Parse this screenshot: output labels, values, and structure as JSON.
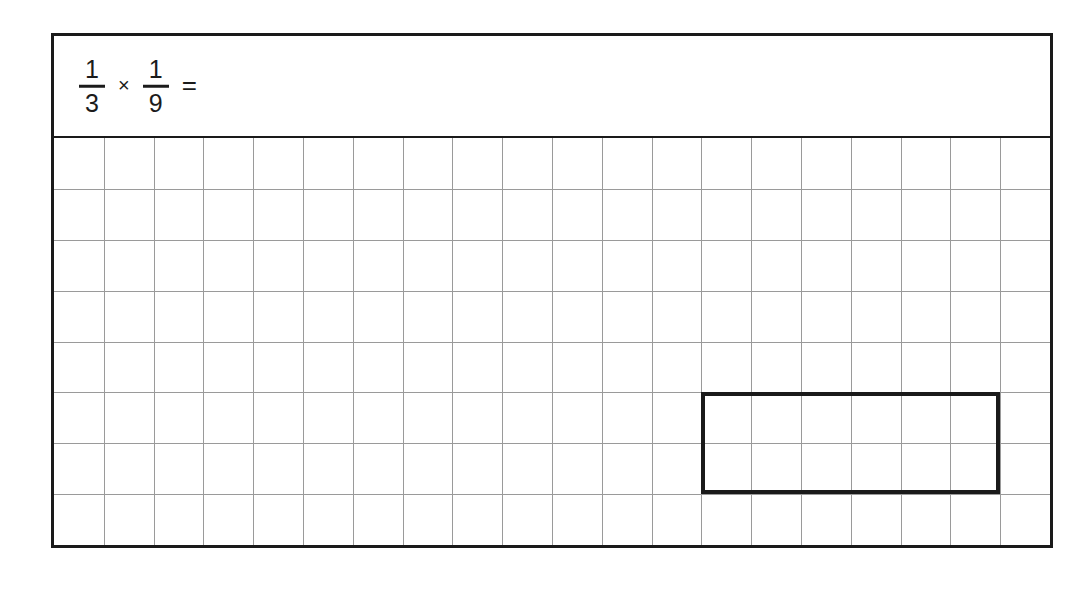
{
  "page": {
    "background_color": "#ffffff",
    "width": 1090,
    "height": 591
  },
  "worksheet": {
    "border_color": "#1a1a1a",
    "background_color": "#ffffff"
  },
  "problem": {
    "first_fraction": {
      "numerator": "1",
      "denominator": "3"
    },
    "operator": "×",
    "second_fraction": {
      "numerator": "1",
      "denominator": "9"
    },
    "equals": "=",
    "answer": ""
  },
  "grid": {
    "columns": 20,
    "rows": 8,
    "cell_width": 50,
    "cell_height": 51,
    "line_color": "#9a9a9a",
    "line_width": 1
  },
  "selection": {
    "start_column": 13,
    "end_column": 19,
    "start_row": 5,
    "end_row": 7,
    "columns_spanned": 6,
    "rows_spanned": 2,
    "border_color": "#1a1a1a",
    "border_width": 4
  }
}
